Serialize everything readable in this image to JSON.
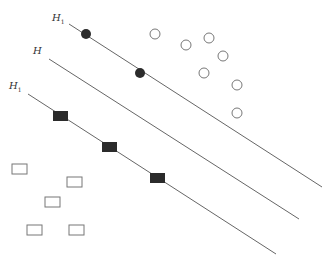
{
  "labels": {
    "h1": {
      "base": "H",
      "sub": "1"
    },
    "h": {
      "base": "H",
      "sub": ""
    },
    "h2": {
      "base": "H",
      "sub": "1"
    }
  },
  "colors": {
    "line": "#666666",
    "filled": "#2b2b2b",
    "hollow_stroke": "#777777"
  },
  "lines": [
    {
      "name": "H1",
      "x1": 69,
      "y1": 24,
      "x2": 322,
      "y2": 187
    },
    {
      "name": "H",
      "x1": 49,
      "y1": 59,
      "x2": 299,
      "y2": 219
    },
    {
      "name": "H2",
      "x1": 28,
      "y1": 94,
      "x2": 276,
      "y2": 254
    }
  ],
  "support_circles": [
    [
      86,
      34
    ],
    [
      140,
      73
    ]
  ],
  "hollow_circles": [
    [
      155,
      34
    ],
    [
      186,
      45
    ],
    [
      209,
      38
    ],
    [
      223,
      56
    ],
    [
      204,
      73
    ],
    [
      237,
      85
    ],
    [
      237,
      113
    ]
  ],
  "support_squares": [
    [
      53,
      111
    ],
    [
      102,
      142
    ],
    [
      150,
      173
    ]
  ],
  "hollow_squares": [
    [
      12,
      164
    ],
    [
      67,
      177
    ],
    [
      45,
      197
    ],
    [
      27,
      225
    ],
    [
      69,
      225
    ]
  ]
}
